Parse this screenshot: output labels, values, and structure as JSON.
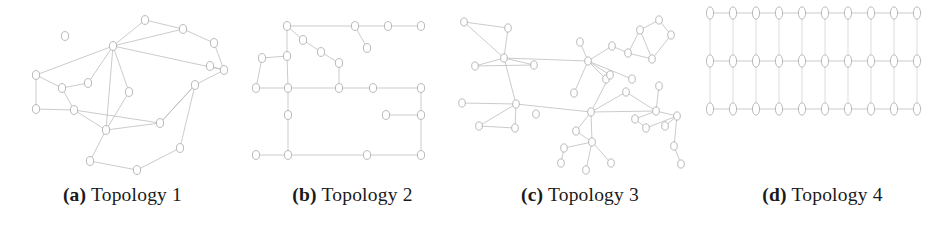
{
  "figure": {
    "background_color": "#ffffff",
    "edge_color": "#b9b9b9",
    "node_stroke_color": "#a8a8a8",
    "node_fill_color": "#ffffff",
    "caption_color": "#1a1a1a",
    "panel_count": 4
  },
  "captions": [
    {
      "tag": "(a)",
      "text": " Topology 1"
    },
    {
      "tag": "(b)",
      "text": " Topology 2"
    },
    {
      "tag": "(c)",
      "text": " Topology 3"
    },
    {
      "tag": "(d)",
      "text": " Topology 4"
    }
  ],
  "chart_data": [
    {
      "type": "scatter",
      "title": "Topology 1",
      "layout": "irregular-mesh",
      "node_count": 21,
      "edge_count": 27,
      "nodes": [
        {
          "id": "1",
          "x": 36,
          "y": 75
        },
        {
          "id": "2",
          "x": 62,
          "y": 88
        },
        {
          "id": "3",
          "x": 88,
          "y": 83
        },
        {
          "id": "4",
          "x": 65,
          "y": 36
        },
        {
          "id": "5",
          "x": 113,
          "y": 46
        },
        {
          "id": "6",
          "x": 145,
          "y": 20
        },
        {
          "id": "7",
          "x": 129,
          "y": 92
        },
        {
          "id": "8",
          "x": 36,
          "y": 109
        },
        {
          "id": "9",
          "x": 90,
          "y": 161
        },
        {
          "id": "10",
          "x": 160,
          "y": 123
        },
        {
          "id": "11",
          "x": 74,
          "y": 110
        },
        {
          "id": "12",
          "x": 106,
          "y": 130
        },
        {
          "id": "13",
          "x": 183,
          "y": 29
        },
        {
          "id": "14",
          "x": 214,
          "y": 43
        },
        {
          "id": "15",
          "x": 224,
          "y": 70
        },
        {
          "id": "16",
          "x": 195,
          "y": 85
        },
        {
          "id": "17",
          "x": 180,
          "y": 148
        },
        {
          "id": "18",
          "x": 137,
          "y": 170
        },
        {
          "id": "19",
          "x": 114,
          "y": 50
        },
        {
          "id": "20",
          "x": 210,
          "y": 66
        },
        {
          "id": "21",
          "x": 67,
          "y": 17
        }
      ],
      "edges": [
        [
          "1",
          "2"
        ],
        [
          "1",
          "8"
        ],
        [
          "1",
          "5"
        ],
        [
          "2",
          "3"
        ],
        [
          "2",
          "11"
        ],
        [
          "3",
          "5"
        ],
        [
          "5",
          "6"
        ],
        [
          "5",
          "7"
        ],
        [
          "5",
          "13"
        ],
        [
          "5",
          "15"
        ],
        [
          "6",
          "13"
        ],
        [
          "13",
          "14"
        ],
        [
          "14",
          "15"
        ],
        [
          "15",
          "20"
        ],
        [
          "15",
          "16"
        ],
        [
          "16",
          "10"
        ],
        [
          "16",
          "17"
        ],
        [
          "8",
          "11"
        ],
        [
          "11",
          "12"
        ],
        [
          "11",
          "10"
        ],
        [
          "12",
          "10"
        ],
        [
          "12",
          "9"
        ],
        [
          "10",
          "16"
        ],
        [
          "9",
          "18"
        ],
        [
          "18",
          "17"
        ],
        [
          "5",
          "12"
        ],
        [
          "7",
          "12"
        ]
      ]
    },
    {
      "type": "scatter",
      "title": "Topology 2",
      "layout": "grid-like-sparse",
      "node_count": 22,
      "edge_count": 22,
      "nodes": [
        {
          "id": "1",
          "x": 11,
          "y": 88
        },
        {
          "id": "2",
          "x": 17,
          "y": 58
        },
        {
          "id": "3",
          "x": 42,
          "y": 56
        },
        {
          "id": "4",
          "x": 42,
          "y": 26
        },
        {
          "id": "5",
          "x": 58,
          "y": 40
        },
        {
          "id": "6",
          "x": 76,
          "y": 52
        },
        {
          "id": "7",
          "x": 94,
          "y": 63
        },
        {
          "id": "8",
          "x": 43,
          "y": 88
        },
        {
          "id": "9",
          "x": 11,
          "y": 88
        },
        {
          "id": "10",
          "x": 94,
          "y": 88
        },
        {
          "id": "11",
          "x": 128,
          "y": 88
        },
        {
          "id": "12",
          "x": 176,
          "y": 88
        },
        {
          "id": "13",
          "x": 43,
          "y": 115
        },
        {
          "id": "14",
          "x": 141,
          "y": 115
        },
        {
          "id": "15",
          "x": 176,
          "y": 115
        },
        {
          "id": "16",
          "x": 11,
          "y": 155
        },
        {
          "id": "17",
          "x": 43,
          "y": 155
        },
        {
          "id": "18",
          "x": 122,
          "y": 155
        },
        {
          "id": "19",
          "x": 176,
          "y": 155
        },
        {
          "id": "20",
          "x": 110,
          "y": 26
        },
        {
          "id": "21",
          "x": 143,
          "y": 26
        },
        {
          "id": "22",
          "x": 176,
          "y": 26
        }
      ],
      "edges": [
        [
          "2",
          "3"
        ],
        [
          "2",
          "1"
        ],
        [
          "3",
          "4"
        ],
        [
          "4",
          "5"
        ],
        [
          "5",
          "6"
        ],
        [
          "6",
          "7"
        ],
        [
          "7",
          "10"
        ],
        [
          "4",
          "8"
        ],
        [
          "8",
          "10"
        ],
        [
          "8",
          "13"
        ],
        [
          "13",
          "17"
        ],
        [
          "9",
          "8"
        ],
        [
          "10",
          "11"
        ],
        [
          "11",
          "12"
        ],
        [
          "14",
          "15"
        ],
        [
          "16",
          "17"
        ],
        [
          "17",
          "18"
        ],
        [
          "18",
          "19"
        ],
        [
          "12",
          "15"
        ],
        [
          "15",
          "19"
        ],
        [
          "4",
          "20"
        ],
        [
          "20",
          "21"
        ]
      ]
    },
    {
      "type": "scatter",
      "title": "Topology 3",
      "layout": "irregular-mesh-dense",
      "node_count": 38,
      "edge_count": 45,
      "nodes": [
        {
          "id": "n1",
          "x": 4,
          "y": 22
        },
        {
          "id": "n2",
          "x": 48,
          "y": 28
        },
        {
          "id": "n3",
          "x": 44,
          "y": 58
        },
        {
          "id": "n4",
          "x": 15,
          "y": 66
        },
        {
          "id": "n5",
          "x": 74,
          "y": 65
        },
        {
          "id": "n6",
          "x": 2,
          "y": 103
        },
        {
          "id": "n7",
          "x": 56,
          "y": 104
        },
        {
          "id": "n8",
          "x": 19,
          "y": 126
        },
        {
          "id": "n9",
          "x": 55,
          "y": 128
        },
        {
          "id": "n10",
          "x": 76,
          "y": 114
        },
        {
          "id": "n11",
          "x": 120,
          "y": 42
        },
        {
          "id": "n12",
          "x": 128,
          "y": 61
        },
        {
          "id": "n13",
          "x": 152,
          "y": 46
        },
        {
          "id": "n14",
          "x": 168,
          "y": 53
        },
        {
          "id": "n15",
          "x": 180,
          "y": 30
        },
        {
          "id": "n16",
          "x": 199,
          "y": 20
        },
        {
          "id": "n17",
          "x": 211,
          "y": 35
        },
        {
          "id": "n18",
          "x": 192,
          "y": 59
        },
        {
          "id": "n19",
          "x": 172,
          "y": 79
        },
        {
          "id": "n20",
          "x": 146,
          "y": 79
        },
        {
          "id": "n21",
          "x": 150,
          "y": 75
        },
        {
          "id": "n22",
          "x": 114,
          "y": 93
        },
        {
          "id": "n23",
          "x": 131,
          "y": 112
        },
        {
          "id": "n24",
          "x": 166,
          "y": 92
        },
        {
          "id": "n25",
          "x": 199,
          "y": 86
        },
        {
          "id": "n26",
          "x": 196,
          "y": 111
        },
        {
          "id": "n27",
          "x": 175,
          "y": 119
        },
        {
          "id": "n28",
          "x": 186,
          "y": 128
        },
        {
          "id": "n29",
          "x": 205,
          "y": 126
        },
        {
          "id": "n30",
          "x": 217,
          "y": 116
        },
        {
          "id": "n31",
          "x": 214,
          "y": 146
        },
        {
          "id": "n32",
          "x": 221,
          "y": 164
        },
        {
          "id": "n33",
          "x": 116,
          "y": 131
        },
        {
          "id": "n34",
          "x": 132,
          "y": 142
        },
        {
          "id": "n35",
          "x": 104,
          "y": 148
        },
        {
          "id": "n36",
          "x": 101,
          "y": 163
        },
        {
          "id": "n37",
          "x": 126,
          "y": 170
        },
        {
          "id": "n38",
          "x": 151,
          "y": 163
        }
      ],
      "edges": [
        [
          "n1",
          "n2"
        ],
        [
          "n1",
          "n3"
        ],
        [
          "n2",
          "n3"
        ],
        [
          "n4",
          "n5"
        ],
        [
          "n3",
          "n5"
        ],
        [
          "n4",
          "n3"
        ],
        [
          "n5",
          "n7"
        ],
        [
          "n6",
          "n7"
        ],
        [
          "n7",
          "n8"
        ],
        [
          "n7",
          "n9"
        ],
        [
          "n8",
          "n9"
        ],
        [
          "n5",
          "n12"
        ],
        [
          "n11",
          "n12"
        ],
        [
          "n12",
          "n13"
        ],
        [
          "n12",
          "n20"
        ],
        [
          "n12",
          "n21"
        ],
        [
          "n13",
          "n14"
        ],
        [
          "n14",
          "n15"
        ],
        [
          "n15",
          "n16"
        ],
        [
          "n16",
          "n17"
        ],
        [
          "n15",
          "n18"
        ],
        [
          "n17",
          "n18"
        ],
        [
          "n14",
          "n18"
        ],
        [
          "n12",
          "n19"
        ],
        [
          "n21",
          "n23"
        ],
        [
          "n7",
          "n23"
        ],
        [
          "n23",
          "n24"
        ],
        [
          "n23",
          "n26"
        ],
        [
          "n24",
          "n26"
        ],
        [
          "n25",
          "n26"
        ],
        [
          "n26",
          "n27"
        ],
        [
          "n26",
          "n30"
        ],
        [
          "n27",
          "n28"
        ],
        [
          "n28",
          "n30"
        ],
        [
          "n29",
          "n30"
        ],
        [
          "n30",
          "n31"
        ],
        [
          "n31",
          "n32"
        ],
        [
          "n23",
          "n33"
        ],
        [
          "n23",
          "n34"
        ],
        [
          "n33",
          "n34"
        ],
        [
          "n34",
          "n35"
        ],
        [
          "n35",
          "n36"
        ],
        [
          "n34",
          "n37"
        ],
        [
          "n34",
          "n38"
        ],
        [
          "n12",
          "n22"
        ]
      ]
    },
    {
      "type": "scatter",
      "title": "Topology 4",
      "layout": "regular-grid",
      "grid_columns": 10,
      "grid_rows": 3,
      "node_count": 30,
      "edge_count": 47,
      "column_spacing_px": 23,
      "row_spacing_px": 48,
      "row_y": [
        13,
        61,
        109
      ],
      "first_column_x": 10
    }
  ]
}
